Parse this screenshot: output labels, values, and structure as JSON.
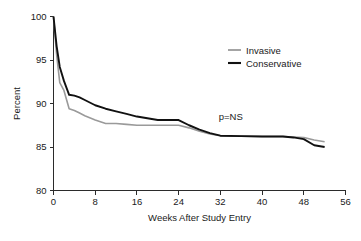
{
  "chart_data": {
    "type": "line",
    "title": "",
    "xlabel": "Weeks After Study Entry",
    "ylabel": "Percent",
    "xlim": [
      0,
      56
    ],
    "ylim": [
      80,
      100
    ],
    "xticks": [
      0,
      8,
      16,
      24,
      32,
      40,
      48,
      56
    ],
    "xtick_labels": [
      "0",
      "8",
      "16",
      "24",
      "32",
      "40",
      "48",
      "56"
    ],
    "yticks": [
      80,
      85,
      90,
      95,
      100
    ],
    "ytick_labels": [
      "80",
      "85",
      "90",
      "95",
      "100"
    ],
    "grid": false,
    "legend_position": "upper right",
    "annotations": [
      {
        "text": "p=NS",
        "x": 34,
        "y": 88.1
      }
    ],
    "series": [
      {
        "name": "Invasive",
        "color": "#9a9a9a",
        "linewidth": 1.6,
        "x": [
          0,
          0.6,
          1.2,
          2,
          3,
          4,
          5,
          6,
          8,
          10,
          12,
          14,
          16,
          18,
          20,
          22,
          24,
          26,
          28,
          30,
          32,
          36,
          40,
          44,
          46,
          48,
          50,
          52
        ],
        "y": [
          100,
          95.6,
          92.4,
          91.5,
          89.4,
          89.2,
          88.9,
          88.6,
          88.1,
          87.7,
          87.7,
          87.6,
          87.5,
          87.5,
          87.5,
          87.5,
          87.5,
          87.2,
          86.8,
          86.5,
          86.3,
          86.25,
          86.2,
          86.2,
          86.15,
          86.1,
          85.8,
          85.6
        ]
      },
      {
        "name": "Conservative",
        "color": "#111111",
        "linewidth": 1.9,
        "x": [
          0,
          0.6,
          1.2,
          2,
          3,
          4,
          5,
          6,
          8,
          10,
          12,
          14,
          16,
          18,
          20,
          22,
          24,
          26,
          28,
          30,
          32,
          36,
          40,
          44,
          46,
          48,
          50,
          52
        ],
        "y": [
          100,
          96.6,
          94.2,
          92.6,
          91.0,
          90.9,
          90.7,
          90.4,
          89.8,
          89.4,
          89.1,
          88.8,
          88.5,
          88.3,
          88.1,
          88.1,
          88.1,
          87.5,
          87.0,
          86.6,
          86.3,
          86.25,
          86.2,
          86.2,
          86.1,
          85.9,
          85.2,
          85.0
        ]
      }
    ]
  },
  "legend": {
    "items": [
      {
        "label": "Invasive",
        "color": "#9a9a9a"
      },
      {
        "label": "Conservative",
        "color": "#111111"
      }
    ]
  },
  "axes": {
    "x_title": "Weeks After Study Entry",
    "y_title": "Percent"
  }
}
